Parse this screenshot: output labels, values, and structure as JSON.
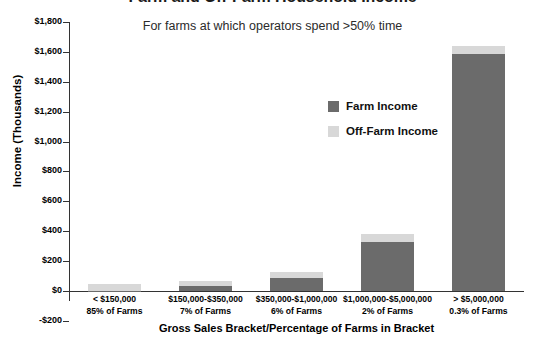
{
  "chart_data": {
    "type": "bar",
    "subtype": "stacked-bar",
    "title": "Farm and Off-Farm Household Income",
    "subtitle": "For farms at which operators spend >50% time",
    "xlabel": "Gross Sales Bracket/Percentage of Farms in Bracket",
    "ylabel": "Income (Thousands)",
    "ylim": [
      -200,
      1800
    ],
    "ytick_step": 200,
    "ytick_labels": [
      "$1,800",
      "$1,600",
      "$1,400",
      "$1,200",
      "$1,000",
      "$800",
      "$600",
      "$400",
      "$200",
      "$0",
      "-$200"
    ],
    "ytick_values": [
      1800,
      1600,
      1400,
      1200,
      1000,
      800,
      600,
      400,
      200,
      0,
      -200
    ],
    "grid": false,
    "legend_position": "inside-upper-right",
    "categories": [
      "< $150,000",
      "$150,000-$350,000",
      "$350,000-$1,000,000",
      "$1,000,000-$5,000,000",
      "> $5,000,000"
    ],
    "category_sublabels": [
      "85% of Farms",
      "7% of Farms",
      "6% of Farms",
      "2% of Farms",
      "0.3% of Farms"
    ],
    "series": [
      {
        "name": "Farm Income",
        "color": "#6b6b6b",
        "values": [
          2,
          35,
          85,
          330,
          1585
        ]
      },
      {
        "name": "Off-Farm Income",
        "color": "#d8d8d8",
        "values": [
          48,
          35,
          45,
          50,
          55
        ]
      }
    ],
    "totals": [
      50,
      70,
      130,
      380,
      1640
    ]
  },
  "legend": {
    "items": [
      {
        "label": "Farm Income",
        "color": "#6b6b6b"
      },
      {
        "label": "Off-Farm Income",
        "color": "#d8d8d8"
      }
    ]
  },
  "colors": {
    "farm_income": "#6b6b6b",
    "off_farm_income": "#d8d8d8",
    "axis": "#333333",
    "text": "#000000",
    "background": "#ffffff"
  }
}
